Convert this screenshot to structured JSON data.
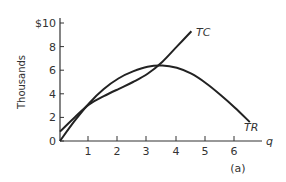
{
  "chart_data": {
    "type": "line",
    "title": "",
    "panel_label": "(a)",
    "xlabel": "q",
    "ylabel": "Thousands",
    "x_ticks": [
      "1",
      "2",
      "3",
      "4",
      "5",
      "6"
    ],
    "y_ticks": [
      "0",
      "2",
      "4",
      "6",
      "8",
      "$10"
    ],
    "xlim": [
      0,
      6.8
    ],
    "ylim": [
      0,
      10
    ],
    "grid": false,
    "series": [
      {
        "name": "TC",
        "x": [
          0,
          0.5,
          1,
          1.5,
          2,
          2.5,
          3,
          3.5,
          4,
          4.5
        ],
        "values": [
          0.8,
          2.0,
          3.1,
          3.8,
          4.4,
          5.0,
          5.7,
          6.7,
          8.0,
          9.3
        ]
      },
      {
        "name": "TR",
        "x": [
          0,
          0.5,
          1,
          1.5,
          2,
          2.5,
          3,
          3.5,
          4,
          4.5,
          5,
          5.5,
          6,
          6.5
        ],
        "values": [
          0,
          1.7,
          3.2,
          4.4,
          5.3,
          5.9,
          6.3,
          6.4,
          6.2,
          5.7,
          4.9,
          3.9,
          2.8,
          1.6
        ]
      }
    ],
    "annotations": [
      "TC",
      "TR"
    ]
  }
}
